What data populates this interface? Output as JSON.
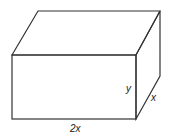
{
  "figure": {
    "type": "rectangular-box",
    "labels": {
      "length": "2x",
      "height": "y",
      "depth": "x"
    },
    "line_color": "#333333",
    "background": "#ffffff"
  }
}
